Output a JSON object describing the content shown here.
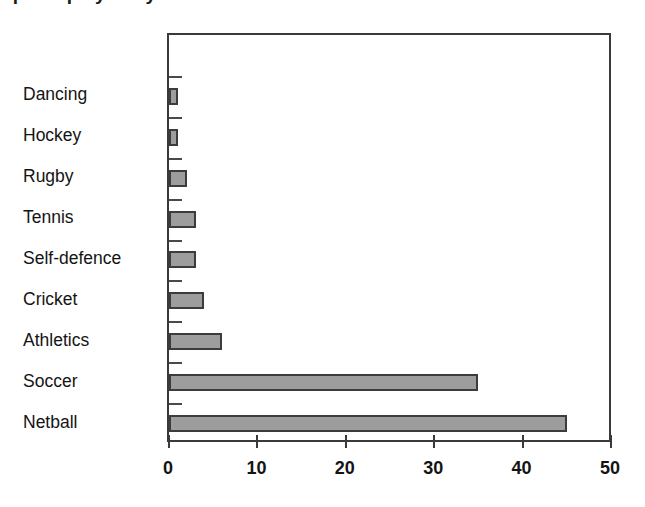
{
  "chart_data": {
    "type": "bar",
    "orientation": "horizontal",
    "title": "",
    "xlabel": "",
    "ylabel": "",
    "categories": [
      "Dancing",
      "Hockey",
      "Rugby",
      "Tennis",
      "Self-defence",
      "Cricket",
      "Athletics",
      "Soccer",
      "Netball"
    ],
    "values": [
      1,
      1,
      2,
      3,
      3,
      4,
      6,
      35,
      45
    ],
    "xlim": [
      0,
      50
    ],
    "xticks": [
      0,
      10,
      20,
      30,
      40,
      50
    ],
    "xtick_labels": [
      "0",
      "10",
      "20",
      "30",
      "40",
      "50"
    ],
    "grid": false,
    "legend": null,
    "series": [
      {
        "name": "Number of students",
        "values": [
          1,
          1,
          2,
          3,
          3,
          4,
          6,
          35,
          45
        ]
      }
    ],
    "bar_fill_color": "#9d9d9d",
    "bar_edge_color": "#3c3c3c",
    "axis_color": "#3a3a3a",
    "background_color": "#ffffff"
  },
  "figure": {
    "cut_off_title": "Sports played by students"
  }
}
